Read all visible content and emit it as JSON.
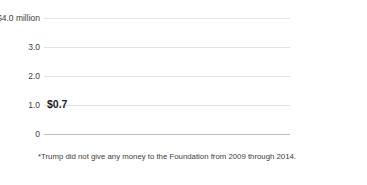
{
  "chart_data": {
    "type": "bar",
    "stacked": true,
    "title": "",
    "subtitle": "",
    "xlabel": "",
    "ylabel": "",
    "categories": [
      "'04",
      "'05",
      "'06",
      "'07",
      "'08",
      "'09",
      "'10",
      "'11",
      "'12",
      "'13",
      "'14"
    ],
    "emphasized_category": "'14",
    "series": [
      {
        "name": "From Trump*",
        "color": "#6e6e6e",
        "values": [
          0.62,
          0.62,
          0.62,
          0,
          0,
          0,
          0,
          0,
          0,
          0,
          0
        ]
      },
      {
        "name": "From donors",
        "color": "#c9c9c9",
        "values": [
          0.08,
          0.1,
          0.12,
          4.25,
          0.5,
          1.2,
          0,
          1.1,
          1.45,
          0.8,
          0.62
        ]
      }
    ],
    "totals": [
      0.7,
      0.72,
      0.74,
      4.25,
      0.5,
      1.2,
      0,
      1.1,
      1.45,
      0.8,
      0.62
    ],
    "ylim": [
      0,
      4.0
    ],
    "y_ticks": [
      0,
      1.0,
      2.0,
      3.0,
      4.0
    ],
    "y_tick_labels": [
      "0",
      "1.0",
      "2.0",
      "3.0",
      "$4.0 million"
    ],
    "grid": true,
    "clipped_bars": [
      "'07"
    ],
    "annotations": [
      {
        "text": "$0.7",
        "category": "'04",
        "value": 0.7
      }
    ],
    "legend_position": "right"
  },
  "axes": {
    "y_labels": [
      {
        "text": "$4.0 million",
        "value": 4.0
      },
      {
        "text": "3.0",
        "value": 3.0
      },
      {
        "text": "2.0",
        "value": 2.0
      },
      {
        "text": "1.0",
        "value": 1.0
      },
      {
        "text": "0",
        "value": 0
      }
    ],
    "x_labels": [
      {
        "text": "'04",
        "emphasis": false
      },
      {
        "text": "'05",
        "emphasis": false
      },
      {
        "text": "'06",
        "emphasis": false
      },
      {
        "text": "'07",
        "emphasis": false
      },
      {
        "text": "'08",
        "emphasis": false
      },
      {
        "text": "'09",
        "emphasis": false
      },
      {
        "text": "'10",
        "emphasis": false
      },
      {
        "text": "'11",
        "emphasis": false
      },
      {
        "text": "'12",
        "emphasis": false
      },
      {
        "text": "'13",
        "emphasis": false
      },
      {
        "text": "'14",
        "emphasis": true
      }
    ]
  },
  "callout": {
    "label": "$0.7"
  },
  "legend": {
    "items": [
      {
        "label": "From donors",
        "color": "#c9c9c9"
      },
      {
        "label": "From Trump*",
        "color": "#6e6e6e"
      }
    ]
  },
  "footnote": {
    "text": "*Trump did not give any money to the Foundation from 2009 through 2014."
  },
  "colors": {
    "donors": "#c9c9c9",
    "trump": "#6e6e6e",
    "gridline": "#e3e3e3",
    "baseline": "#bfbfbf",
    "background": "#ffffff",
    "text": "#3d3d3d"
  }
}
